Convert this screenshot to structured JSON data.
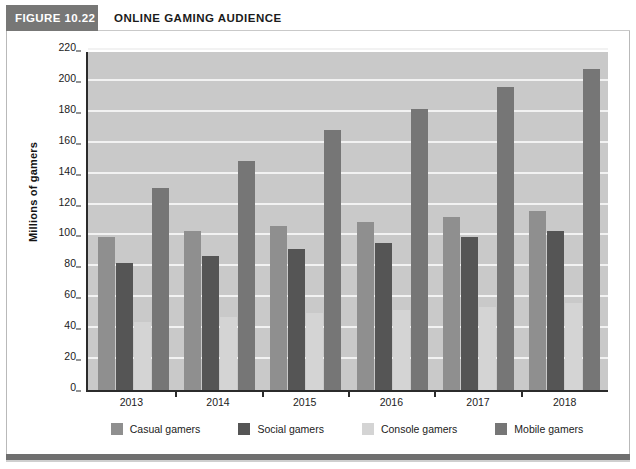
{
  "figure": {
    "tag": "FIGURE 10.22",
    "title": "ONLINE GAMING AUDIENCE"
  },
  "colors": {
    "casual": "#8f8f8f",
    "social": "#555555",
    "console": "#d4d4d4",
    "mobile": "#767676",
    "plot_background": "#c9c9c9",
    "gridline": "#f2f2f2",
    "axis": "#2b2b2b",
    "header_tag_background": "#777776"
  },
  "chart_data": {
    "type": "bar",
    "title": "ONLINE GAMING AUDIENCE",
    "xlabel": "",
    "ylabel": "Millions of gamers",
    "ylim": [
      0,
      220
    ],
    "ytick_step": 20,
    "yticks": [
      0,
      20,
      40,
      60,
      80,
      100,
      120,
      140,
      160,
      180,
      200,
      220
    ],
    "ytick_labels": [
      "0",
      "20",
      "40",
      "60",
      "80",
      "100",
      "120",
      "140",
      "160",
      "180",
      "200",
      "220"
    ],
    "grid": true,
    "legend_position": "bottom",
    "categories": [
      "2013",
      "2014",
      "2015",
      "2016",
      "2017",
      "2018"
    ],
    "series": [
      {
        "name": "Casual gamers",
        "color_key": "casual",
        "values": [
          99,
          103,
          106,
          109,
          112,
          116
        ]
      },
      {
        "name": "Social gamers",
        "color_key": "social",
        "values": [
          82,
          87,
          91,
          95,
          99,
          103
        ]
      },
      {
        "name": "Console gamers",
        "color_key": "console",
        "values": [
          44,
          47,
          50,
          52,
          54,
          56
        ]
      },
      {
        "name": "Mobile gamers",
        "color_key": "mobile",
        "values": [
          131,
          148,
          168,
          182,
          196,
          208
        ]
      }
    ]
  },
  "legend": {
    "items": [
      {
        "label": "Casual gamers",
        "color_key": "casual"
      },
      {
        "label": "Social gamers",
        "color_key": "social"
      },
      {
        "label": "Console gamers",
        "color_key": "console"
      },
      {
        "label": "Mobile gamers",
        "color_key": "mobile"
      }
    ]
  }
}
